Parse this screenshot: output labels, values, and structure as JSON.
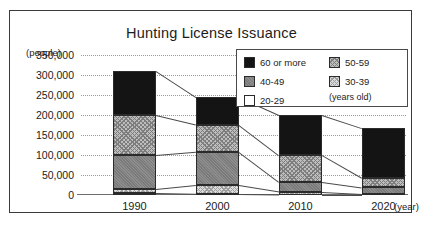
{
  "chart_data": {
    "type": "bar",
    "title": "Hunting License Issuance",
    "xlabel": "(year)",
    "ylabel": "(people)",
    "categories": [
      "1990",
      "2000",
      "2010",
      "2020"
    ],
    "ylim": [
      0,
      350000
    ],
    "yticks": [
      "0",
      "50,000",
      "100,000",
      "150,000",
      "200,000",
      "250,000",
      "300,000",
      "350,000"
    ],
    "ytick_values": [
      0,
      50000,
      100000,
      150000,
      200000,
      250000,
      300000,
      350000
    ],
    "grid": true,
    "stacked": true,
    "legend_position": "top-right",
    "legend_note": "(years old)",
    "series": [
      {
        "name": "20-29",
        "values": [
          4000,
          2000,
          1000,
          1000
        ]
      },
      {
        "name": "30-39",
        "values": [
          10000,
          22000,
          7000,
          2000
        ]
      },
      {
        "name": "40-49",
        "values": [
          86000,
          84000,
          25000,
          16000
        ]
      },
      {
        "name": "50-59",
        "values": [
          100000,
          68000,
          67000,
          24000
        ]
      },
      {
        "name": "60 or more",
        "values": [
          110000,
          69000,
          100000,
          124000
        ]
      }
    ],
    "totals": [
      310000,
      245000,
      200000,
      167000
    ]
  },
  "legend": {
    "items": [
      {
        "label": "60 or more",
        "pattern": "solid-black"
      },
      {
        "label": "50-59",
        "pattern": "checker-light"
      },
      {
        "label": "40-49",
        "pattern": "gray-hatch"
      },
      {
        "label": "30-39",
        "pattern": "checker-pale"
      },
      {
        "label": "20-29",
        "pattern": "white"
      }
    ],
    "note": "(years old)"
  }
}
